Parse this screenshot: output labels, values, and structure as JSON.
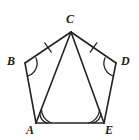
{
  "figure": {
    "kind": "geometry-diagram",
    "stroke_color": "#232323",
    "label_color": "#1a1a1a",
    "background_color": "#ffffff",
    "vertices": [
      {
        "name": "C",
        "label": "C",
        "x": 71,
        "y": 32
      },
      {
        "name": "B",
        "label": "B",
        "x": 25,
        "y": 63
      },
      {
        "name": "D",
        "label": "D",
        "x": 116,
        "y": 63
      },
      {
        "name": "A",
        "label": "A",
        "x": 36,
        "y": 123
      },
      {
        "name": "E",
        "label": "E",
        "x": 104,
        "y": 123
      }
    ],
    "edges": [
      {
        "name": "segment-BC",
        "from": "B",
        "to": "C",
        "ticks": 1
      },
      {
        "name": "segment-CD",
        "from": "C",
        "to": "D",
        "ticks": 1
      },
      {
        "name": "segment-AB",
        "from": "A",
        "to": "B",
        "ticks": 0
      },
      {
        "name": "segment-DE",
        "from": "D",
        "to": "E",
        "ticks": 0
      },
      {
        "name": "segment-AE",
        "from": "A",
        "to": "E",
        "ticks": 0
      },
      {
        "name": "diagonal-CA",
        "from": "C",
        "to": "A",
        "ticks": 0
      },
      {
        "name": "diagonal-CE",
        "from": "C",
        "to": "E",
        "ticks": 0
      }
    ],
    "angle_marks": [
      {
        "name": "angle-B",
        "vertex": "B",
        "arcs": 1
      },
      {
        "name": "angle-D",
        "vertex": "D",
        "arcs": 1
      },
      {
        "name": "angle-CAE",
        "vertex": "A",
        "arcs": 2
      },
      {
        "name": "angle-CEA",
        "vertex": "E",
        "arcs": 2
      }
    ]
  }
}
